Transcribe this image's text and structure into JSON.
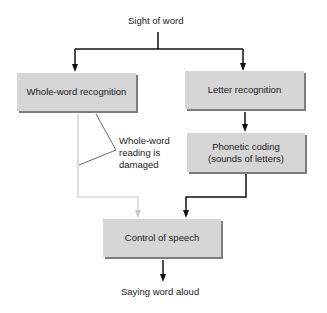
{
  "diagram": {
    "title_top": "Sight of word",
    "nodes": {
      "whole_word": "Whole-word recognition",
      "letter": "Letter recognition",
      "phonetic_line1": "Phonetic coding",
      "phonetic_line2": "(sounds of letters)",
      "speech": "Control of speech"
    },
    "output": "Saying word aloud",
    "annotation": {
      "line1": "Whole-word",
      "line2": "reading is",
      "line3": "damaged"
    },
    "colors": {
      "box_fill": "#d6d6d6",
      "box_shadow": "#7d7d7d",
      "active_path": "#111111",
      "damaged_path": "#c8c8c8"
    }
  }
}
